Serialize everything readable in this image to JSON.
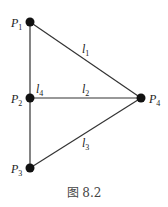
{
  "figure": {
    "caption": "图 8.2",
    "nodes": [
      {
        "id": "P1",
        "base": "P",
        "sub": "1",
        "x": 30,
        "y": 22
      },
      {
        "id": "P2",
        "base": "P",
        "sub": "2",
        "x": 30,
        "y": 98
      },
      {
        "id": "P3",
        "base": "P",
        "sub": "3",
        "x": 30,
        "y": 168
      },
      {
        "id": "P4",
        "base": "P",
        "sub": "4",
        "x": 141,
        "y": 98
      }
    ],
    "edges": [
      {
        "id": "l1",
        "base": "l",
        "sub": "1",
        "from": "P1",
        "to": "P4"
      },
      {
        "id": "l2",
        "base": "l",
        "sub": "2",
        "from": "P2",
        "to": "P4"
      },
      {
        "id": "l3",
        "base": "l",
        "sub": "3",
        "from": "P3",
        "to": "P4"
      },
      {
        "id": "l4",
        "base": "l",
        "sub": "4",
        "from": "P1",
        "to": "P3"
      }
    ],
    "colors": {
      "line": "#333333",
      "node": "#111111"
    }
  }
}
